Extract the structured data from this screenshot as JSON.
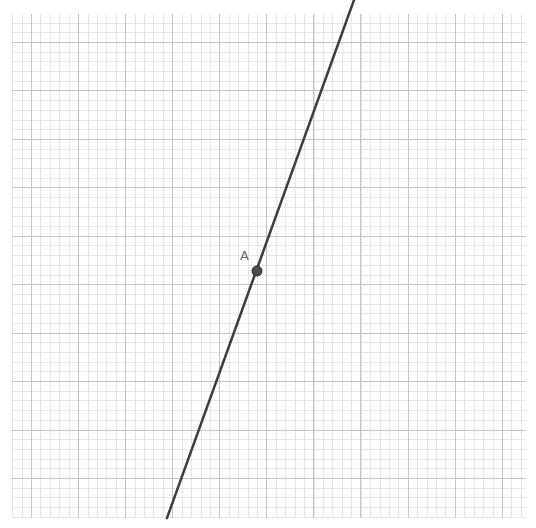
{
  "canvas": {
    "width": 536,
    "height": 528,
    "background": "#ffffff"
  },
  "grid": {
    "left": 12,
    "top": 14,
    "right": 526,
    "bottom": 518,
    "major_x": [
      31,
      78,
      125,
      172,
      219,
      266,
      313,
      360,
      408,
      455,
      502
    ],
    "major_y": [
      42,
      90,
      139,
      187,
      236,
      284,
      333,
      381,
      430,
      478
    ],
    "subdivisions": 5,
    "major_color": "#c4c4c4",
    "minor_color": "#e6e6e6"
  },
  "line": {
    "x1": 354,
    "y1": 0,
    "x2": 167,
    "y2": 518,
    "color": "#3d3d3d",
    "width": 2.5
  },
  "points": [
    {
      "label": "A",
      "x": 257,
      "y": 271,
      "radius": 5,
      "fill": "#4d4d4d",
      "stroke": "#2a2a2a",
      "label_x": 240,
      "label_y": 248
    }
  ]
}
